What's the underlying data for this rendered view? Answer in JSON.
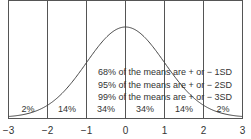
{
  "chart_data": {
    "type": "line",
    "title": "",
    "xlabel": "",
    "ylabel": "",
    "x_ticks": [
      "−3",
      "−2",
      "−1",
      "0",
      "1",
      "2",
      "3"
    ],
    "xlim": [
      -3,
      3
    ],
    "grid": "vertical lines at each integer SD",
    "series": [
      {
        "name": "normal distribution",
        "function": "standard normal density"
      }
    ],
    "region_labels": [
      "2%",
      "14%",
      "34%",
      "34%",
      "14%",
      "2%"
    ],
    "annotations": [
      "68% of the means are + or − 1SD",
      "95% of the means are + or − 2SD",
      "99% of the means are + or − 3SD"
    ]
  }
}
